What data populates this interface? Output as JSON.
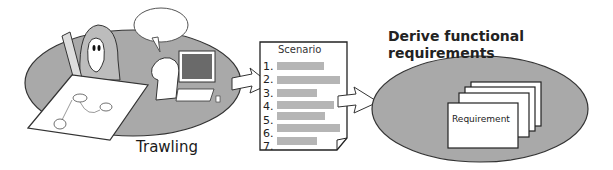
{
  "diagram": {
    "left_bubble": {
      "label": "Trawling"
    },
    "scenario": {
      "title": "Scenario",
      "steps": [
        "1.",
        "2.",
        "3.",
        "4.",
        "5.",
        "6.",
        "7."
      ]
    },
    "right_bubble": {
      "title_line1": "Derive functional",
      "title_line2": "requirements",
      "card_label": "Requirement"
    },
    "colors": {
      "bubble_fill": "#a9a9a9",
      "bubble_stroke": "#333333",
      "line_fill": "#b5b5b5",
      "paper": "#ffffff"
    }
  }
}
